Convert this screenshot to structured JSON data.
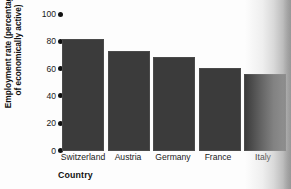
{
  "chart_data": {
    "type": "bar",
    "title": "",
    "categories": [
      "Switzerland",
      "Austria",
      "Germany",
      "France",
      "Italy"
    ],
    "values": [
      82,
      73,
      68.5,
      60.5,
      56
    ],
    "xlabel": "Country",
    "ylabel": "Employment rate (percentage\nof economically active)",
    "ylabel_line1": "Employment rate (percentage",
    "ylabel_line2": "of economically active)",
    "ylim": [
      0,
      100
    ],
    "yticks": [
      0,
      20,
      40,
      60,
      80,
      100
    ],
    "ytick_labels": [
      "0",
      "20",
      "40",
      "60",
      "80",
      "100"
    ],
    "grid": false,
    "legend": false,
    "bar_color": "#3b3b3b",
    "tick_marker": "filled-circle"
  },
  "axis": {
    "y_title_line1": "Employment rate (percentage",
    "y_title_line2": "of economically active)",
    "x_title": "Country",
    "y_tick_0": "0",
    "y_tick_1": "20",
    "y_tick_2": "40",
    "y_tick_3": "60",
    "y_tick_4": "80",
    "y_tick_5": "100"
  },
  "bars": [
    {
      "label": "Switzerland",
      "value": 82
    },
    {
      "label": "Austria",
      "value": 73
    },
    {
      "label": "Germany",
      "value": 68.5
    },
    {
      "label": "France",
      "value": 60.5
    },
    {
      "label": "Italy",
      "value": 56
    }
  ]
}
